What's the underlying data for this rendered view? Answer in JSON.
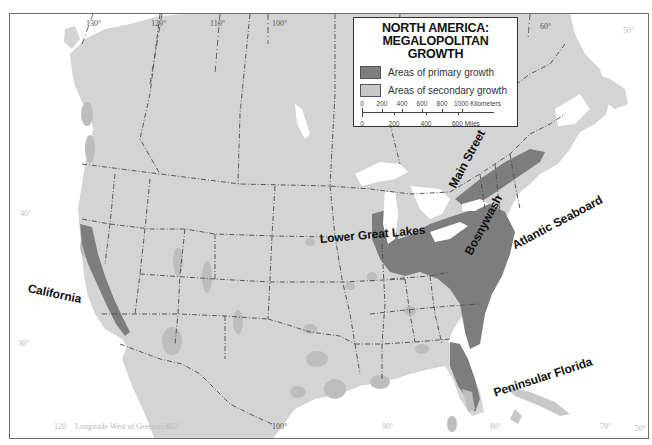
{
  "legend": {
    "title_line1": "NORTH AMERICA:",
    "title_line2": "MEGALOPOLITAN GROWTH",
    "items": [
      {
        "label": "Areas of primary growth",
        "color": "#7d7d7d"
      },
      {
        "label": "Areas of secondary growth",
        "color": "#c8c8c8"
      }
    ],
    "scale": {
      "km_labels": [
        "0",
        "200",
        "400",
        "600",
        "800",
        "1000 Kilometers"
      ],
      "mile_labels": [
        "0",
        "200",
        "400",
        "600 Miles"
      ]
    }
  },
  "regions": [
    {
      "name": "California"
    },
    {
      "name": "Lower Great Lakes"
    },
    {
      "name": "Main Street"
    },
    {
      "name": "Bosnywash"
    },
    {
      "name": "Atlantic Seaboard"
    },
    {
      "name": "Peninsular Florida"
    }
  ],
  "graticule": {
    "longitude_top": [
      "130°",
      "120°",
      "110°",
      "100°",
      "60°",
      "50°"
    ],
    "longitude_bottom": [
      "120",
      "Longitude West of Greenwich",
      "110°",
      "100°",
      "90°",
      "80°",
      "70°",
      "50°"
    ],
    "latitude_left": [
      "50°",
      "40°",
      "30°"
    ]
  },
  "colors": {
    "land": "#d4d4d4",
    "water": "#ffffff",
    "primary_growth": "#7d7d7d",
    "secondary_growth": "#bdbdbd",
    "border": "#4a4a4a"
  }
}
